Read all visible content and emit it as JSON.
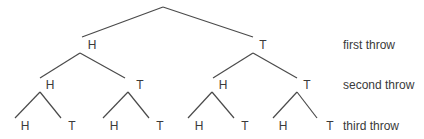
{
  "diagram": {
    "type": "probability-tree",
    "row_labels": [
      "first throw",
      "second throw",
      "third throw"
    ],
    "level1": [
      "H",
      "T"
    ],
    "level2": [
      "H",
      "T",
      "H",
      "T"
    ],
    "level3": [
      "H",
      "T",
      "H",
      "T",
      "H",
      "T",
      "H",
      "T"
    ],
    "line_color": "#4a4a4a",
    "text_color": "#3a3a3a"
  }
}
